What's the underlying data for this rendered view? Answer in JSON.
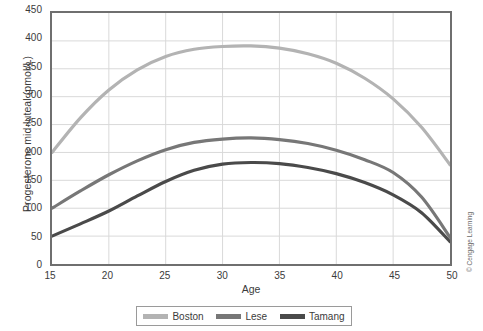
{
  "chart_data": {
    "type": "line",
    "title": "",
    "xlabel": "Age",
    "ylabel": "Progesterone mid-luteal (pmol/L)",
    "xlim": [
      15,
      50
    ],
    "ylim": [
      0,
      450
    ],
    "xticks": [
      15,
      20,
      25,
      30,
      35,
      40,
      45,
      50
    ],
    "yticks": [
      0,
      50,
      100,
      150,
      200,
      250,
      300,
      350,
      400,
      450
    ],
    "grid": true,
    "legend_position": "bottom",
    "x": [
      15,
      17.5,
      20,
      22.5,
      25,
      27.5,
      30,
      32.5,
      35,
      37.5,
      40,
      42.5,
      45,
      47.5,
      50
    ],
    "series": [
      {
        "name": "Boston",
        "color": "#b3b3b3",
        "values": [
          200,
          262,
          312,
          348,
          372,
          385,
          390,
          391,
          387,
          377,
          360,
          333,
          296,
          245,
          178
        ]
      },
      {
        "name": "Lese",
        "color": "#777777",
        "values": [
          100,
          131,
          160,
          185,
          205,
          218,
          224,
          226,
          223,
          216,
          204,
          187,
          164,
          120,
          48
        ]
      },
      {
        "name": "Tamang",
        "color": "#4a4a4a",
        "values": [
          50,
          72,
          95,
          122,
          148,
          168,
          179,
          182,
          180,
          173,
          162,
          146,
          124,
          92,
          40
        ]
      }
    ],
    "colors": {
      "boston": "#b3b3b3",
      "lese": "#777777",
      "tamang": "#4a4a4a",
      "axis": "#6f6f6f",
      "grid": "#d8d8d8",
      "text": "#3b3b3b"
    }
  },
  "legend": {
    "items": [
      {
        "label": "Boston"
      },
      {
        "label": "Lese"
      },
      {
        "label": "Tamang"
      }
    ]
  },
  "credit": {
    "text": "© Cengage Learning"
  }
}
